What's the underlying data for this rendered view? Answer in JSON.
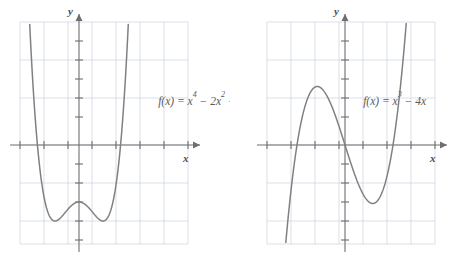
{
  "page": {
    "background_color": "#ffffff",
    "width": 460,
    "height": 262
  },
  "style": {
    "curve_color": "#808080",
    "axis_color": "#6e6e6e",
    "grid_color": "#c9d3e0",
    "label_color": "#4d4d4d",
    "equation_color": "#5a5a5a"
  },
  "figures": [
    {
      "id": "figure-left",
      "equation": "f(x) = x⁴ − 2x² − 3",
      "equation_parts": {
        "lhs": "f(x) = x",
        "exp1": "4",
        "mid": " − 2x",
        "exp2": "2",
        "tail": " − 3"
      },
      "x_axis_label": "x",
      "y_axis_label": "y"
    },
    {
      "id": "figure-right",
      "equation": "f(x) = x³ − 4x",
      "equation_parts": {
        "lhs": "f(x) = x",
        "exp1": "3",
        "mid": " − 4x",
        "exp2": "",
        "tail": ""
      },
      "x_axis_label": "x",
      "y_axis_label": "y"
    }
  ],
  "chart_data": [
    {
      "type": "line",
      "id": "quartic-plot",
      "title": "f(x) = x⁴ − 2x² − 3",
      "function": "x^4 - 2x^2 - 3",
      "xlabel": "x",
      "ylabel": "y",
      "xlim": [
        -3.5,
        3.5
      ],
      "ylim": [
        -5.5,
        6.0
      ],
      "grid": true,
      "grid_spacing_x": 1,
      "grid_spacing_y": 1,
      "tick_spacing_x": 0.5,
      "tick_spacing_y": 0.5,
      "x_intercepts": [
        -1.732,
        1.732
      ],
      "y_intercept": -3,
      "local_minima": [
        [
          -1,
          -4
        ],
        [
          1,
          -4
        ]
      ],
      "local_maxima": [
        [
          0,
          -3
        ]
      ],
      "x": [
        -2.1,
        -2.0,
        -1.9,
        -1.8,
        -1.732,
        -1.6,
        -1.4,
        -1.2,
        -1.0,
        -0.8,
        -0.6,
        -0.4,
        -0.2,
        0.0,
        0.2,
        0.4,
        0.6,
        0.8,
        1.0,
        1.2,
        1.4,
        1.6,
        1.732,
        1.8,
        1.9,
        2.0,
        2.1
      ],
      "y": [
        10.63,
        5.0,
        5.82,
        3.02,
        0.0,
        -1.57,
        -3.08,
        -3.8,
        -4.0,
        -3.87,
        -3.59,
        -3.29,
        -3.08,
        -3.0,
        -3.08,
        -3.29,
        -3.59,
        -3.87,
        -4.0,
        -3.8,
        -3.08,
        -1.57,
        0.0,
        3.02,
        5.82,
        5.0,
        10.63
      ],
      "legend": false
    },
    {
      "type": "line",
      "id": "cubic-plot",
      "title": "f(x) = x³ − 4x",
      "function": "x^3 - 4x",
      "xlabel": "x",
      "ylabel": "y",
      "xlim": [
        -3.5,
        3.5
      ],
      "ylim": [
        -5.5,
        6.0
      ],
      "grid": true,
      "grid_spacing_x": 1,
      "grid_spacing_y": 1,
      "tick_spacing_x": 0.5,
      "tick_spacing_y": 0.5,
      "x_intercepts": [
        -2,
        0,
        2
      ],
      "y_intercept": 0,
      "local_minima": [
        [
          1.155,
          -3.079
        ]
      ],
      "local_maxima": [
        [
          -1.155,
          3.079
        ]
      ],
      "x": [
        -2.4,
        -2.2,
        -2.0,
        -1.8,
        -1.6,
        -1.4,
        -1.155,
        -1.0,
        -0.8,
        -0.6,
        -0.4,
        -0.2,
        0.0,
        0.2,
        0.4,
        0.6,
        0.8,
        1.0,
        1.155,
        1.4,
        1.6,
        1.8,
        2.0,
        2.2,
        2.4
      ],
      "y": [
        -4.22,
        -1.85,
        0.0,
        1.37,
        2.3,
        2.86,
        3.08,
        3.0,
        2.69,
        2.18,
        1.54,
        0.79,
        0.0,
        -0.79,
        -1.54,
        -2.18,
        -2.69,
        -3.0,
        -3.08,
        -2.86,
        -2.3,
        -1.37,
        0.0,
        1.85,
        4.22
      ],
      "legend": false
    }
  ]
}
